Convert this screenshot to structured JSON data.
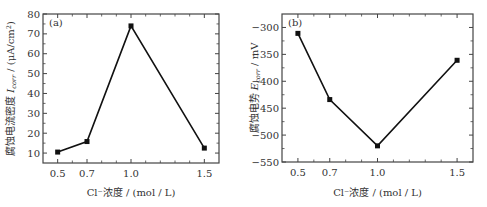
{
  "chart_data": [
    {
      "type": "line",
      "panel_label": "(a)",
      "title": "",
      "xlabel": "Cl⁻浓度 / (mol / L)",
      "ylabel": "腐蚀电流密度 I_corr / (μA/cm²)",
      "ylabel_parts": {
        "prefix": "腐蚀电流密度 ",
        "symbol": "I",
        "subscript": "corr",
        "suffix": " / (μA/cm",
        "sup": "2",
        "end": ")"
      },
      "xlim": [
        0.4,
        1.6
      ],
      "ylim": [
        5,
        80
      ],
      "xticks": [
        0.5,
        0.7,
        1.0,
        1.5
      ],
      "xtick_labels": [
        "0.5",
        "0.7",
        "1.0",
        "1.5"
      ],
      "xminor": [
        0.6,
        0.8,
        0.9,
        1.1,
        1.2,
        1.3,
        1.4
      ],
      "yticks": [
        10,
        20,
        30,
        40,
        50,
        60,
        70,
        80
      ],
      "ytick_labels": [
        "10",
        "20",
        "30",
        "40",
        "50",
        "60",
        "70",
        "80"
      ],
      "grid": false,
      "series": [
        {
          "name": "Icorr",
          "x": [
            0.5,
            0.7,
            1.0,
            1.5
          ],
          "y": [
            10.5,
            15.8,
            74.0,
            12.5
          ],
          "marker": "square",
          "color": "#111111"
        }
      ]
    },
    {
      "type": "line",
      "panel_label": "(b)",
      "title": "",
      "xlabel": "Cl⁻浓度 / (mol / L)",
      "ylabel": "腐蚀电势 E_corr / mV",
      "ylabel_parts": {
        "prefix": "腐蚀电势 ",
        "symbol": "E",
        "subscript": "corr",
        "suffix": " / mV"
      },
      "xlim": [
        0.4,
        1.6
      ],
      "ylim": [
        -550,
        -275
      ],
      "xticks": [
        0.5,
        0.7,
        1.0,
        1.5
      ],
      "xtick_labels": [
        "0.5",
        "0.7",
        "1.0",
        "1.5"
      ],
      "xminor": [
        0.6,
        0.8,
        0.9,
        1.1,
        1.2,
        1.3,
        1.4
      ],
      "yticks": [
        -550,
        -500,
        -450,
        -400,
        -350,
        -300
      ],
      "ytick_labels": [
        "−550",
        "−500",
        "−450",
        "−400",
        "−350",
        "−300"
      ],
      "grid": false,
      "series": [
        {
          "name": "Ecorr",
          "x": [
            0.5,
            0.7,
            1.0,
            1.5
          ],
          "y": [
            -311,
            -434,
            -520,
            -361
          ],
          "marker": "square",
          "color": "#111111"
        }
      ]
    }
  ]
}
